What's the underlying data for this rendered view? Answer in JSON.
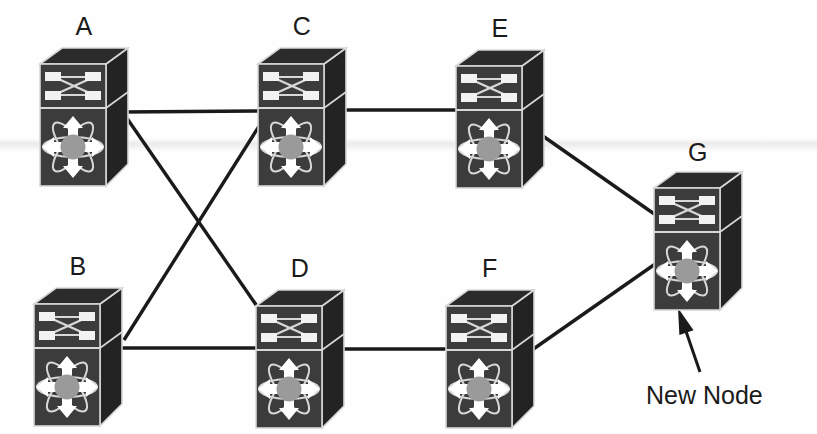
{
  "diagram": {
    "background_color": "#fefefe",
    "link_color": "#1a1a1a",
    "icon_front_color": "#3c3c3c",
    "icon_top_color": "#2b2b2b",
    "icon_side_color": "#232323",
    "icon_outline_color": "#d8d8d8",
    "icon_hub_color": "#9a9a9a",
    "icon_port_color": "#f2f2f2",
    "label_color": "#1a1a1a"
  },
  "nodes": [
    {
      "id": "A",
      "label": "A",
      "icon": "multilayer-switch-icon",
      "x": 38,
      "y": 46,
      "w": 92,
      "h": 142,
      "label_x": 38,
      "label_y": 14
    },
    {
      "id": "C",
      "label": "C",
      "icon": "multilayer-switch-icon",
      "x": 256,
      "y": 46,
      "w": 92,
      "h": 142,
      "label_x": 256,
      "label_y": 14
    },
    {
      "id": "E",
      "label": "E",
      "icon": "multilayer-switch-icon",
      "x": 454,
      "y": 48,
      "w": 92,
      "h": 142,
      "label_x": 454,
      "label_y": 16
    },
    {
      "id": "G",
      "label": "G",
      "icon": "multilayer-switch-icon",
      "x": 652,
      "y": 170,
      "w": 92,
      "h": 142,
      "label_x": 652,
      "label_y": 140
    },
    {
      "id": "B",
      "label": "B",
      "icon": "multilayer-switch-icon",
      "x": 32,
      "y": 286,
      "w": 92,
      "h": 142,
      "label_x": 32,
      "label_y": 254
    },
    {
      "id": "D",
      "label": "D",
      "icon": "multilayer-switch-icon",
      "x": 254,
      "y": 288,
      "w": 92,
      "h": 142,
      "label_x": 254,
      "label_y": 256
    },
    {
      "id": "F",
      "label": "F",
      "icon": "multilayer-switch-icon",
      "x": 444,
      "y": 288,
      "w": 92,
      "h": 142,
      "label_x": 444,
      "label_y": 256
    }
  ],
  "links": [
    {
      "id": "A-C",
      "from": "A",
      "to": "C",
      "x1": 122,
      "y1": 112,
      "x2": 262,
      "y2": 111
    },
    {
      "id": "C-E",
      "from": "C",
      "to": "E",
      "x1": 344,
      "y1": 110,
      "x2": 462,
      "y2": 110
    },
    {
      "id": "E-G",
      "from": "E",
      "to": "G",
      "x1": 540,
      "y1": 134,
      "x2": 660,
      "y2": 218
    },
    {
      "id": "A-D",
      "from": "A",
      "to": "D",
      "x1": 124,
      "y1": 114,
      "x2": 268,
      "y2": 322
    },
    {
      "id": "B-C",
      "from": "B",
      "to": "C",
      "x1": 124,
      "y1": 340,
      "x2": 268,
      "y2": 112
    },
    {
      "id": "B-D",
      "from": "B",
      "to": "D",
      "x1": 122,
      "y1": 348,
      "x2": 262,
      "y2": 348
    },
    {
      "id": "D-F",
      "from": "D",
      "to": "F",
      "x1": 340,
      "y1": 349,
      "x2": 452,
      "y2": 349
    },
    {
      "id": "F-G",
      "from": "F",
      "to": "G",
      "x1": 532,
      "y1": 350,
      "x2": 658,
      "y2": 262
    }
  ],
  "annotation": {
    "id": "new-node-callout",
    "text": "New Node",
    "text_x": 646,
    "text_y": 382,
    "arrow": {
      "tail_x": 700,
      "tail_y": 372,
      "head_x": 678,
      "head_y": 308
    },
    "points_to": "G"
  }
}
